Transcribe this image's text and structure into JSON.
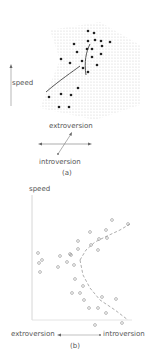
{
  "panel_a": {
    "caption": "(a)",
    "speed_label": "speed",
    "extroversion_label": "extroversion",
    "introversion_label": "introversion",
    "dots": [
      [
        88,
        31
      ],
      [
        94,
        33
      ],
      [
        74,
        44
      ],
      [
        88,
        41
      ],
      [
        95,
        40
      ],
      [
        101,
        41
      ],
      [
        110,
        42
      ],
      [
        77,
        52
      ],
      [
        87,
        49
      ],
      [
        92,
        49
      ],
      [
        102,
        46
      ],
      [
        61,
        59
      ],
      [
        70,
        63
      ],
      [
        82,
        61
      ],
      [
        92,
        57
      ],
      [
        101,
        54
      ],
      [
        83,
        68
      ],
      [
        97,
        65
      ],
      [
        88,
        72
      ],
      [
        78,
        88
      ],
      [
        49,
        97
      ],
      [
        61,
        94
      ],
      [
        71,
        95
      ],
      [
        59,
        107
      ],
      [
        69,
        107
      ]
    ],
    "colors": {
      "dot": "#222222",
      "shade": "#bbbbbb",
      "fold": "#555555"
    }
  },
  "panel_b": {
    "caption": "(b)",
    "chart_data": {
      "type": "scatter",
      "title": "",
      "ylabel": "speed",
      "xlabel_left": "extroversion",
      "xlabel_right": "introversion",
      "x_direction": "extroversion ← → introversion",
      "grid": false,
      "points": [
        [
          38,
          73
        ],
        [
          39,
          83
        ],
        [
          42,
          80
        ],
        [
          40,
          92
        ],
        [
          58,
          87
        ],
        [
          60,
          76
        ],
        [
          67,
          82
        ],
        [
          71,
          75
        ],
        [
          70,
          74
        ],
        [
          74,
          85
        ],
        [
          78,
          61
        ],
        [
          78,
          69
        ],
        [
          75,
          99
        ],
        [
          72,
          113
        ],
        [
          80,
          113
        ],
        [
          84,
          120
        ],
        [
          89,
          128
        ],
        [
          83,
          106
        ],
        [
          90,
          52
        ],
        [
          98,
          70
        ],
        [
          91,
          65
        ],
        [
          99,
          59
        ],
        [
          106,
          50
        ],
        [
          107,
          58
        ],
        [
          112,
          40
        ],
        [
          128,
          44
        ],
        [
          102,
          117
        ],
        [
          106,
          133
        ],
        [
          116,
          119
        ],
        [
          122,
          143
        ],
        [
          98,
          128
        ],
        [
          95,
          145
        ]
      ],
      "fit_upper": [
        [
          80,
          80
        ],
        [
          86,
          70
        ],
        [
          95,
          62
        ],
        [
          105,
          57
        ],
        [
          120,
          50
        ],
        [
          130,
          44
        ]
      ],
      "fit_lower": [
        [
          80,
          80
        ],
        [
          83,
          95
        ],
        [
          90,
          108
        ],
        [
          100,
          120
        ],
        [
          115,
          130
        ],
        [
          128,
          140
        ]
      ],
      "colors": {
        "point": "#888888",
        "axis": "#cccccc",
        "fit": "#999999"
      }
    }
  }
}
